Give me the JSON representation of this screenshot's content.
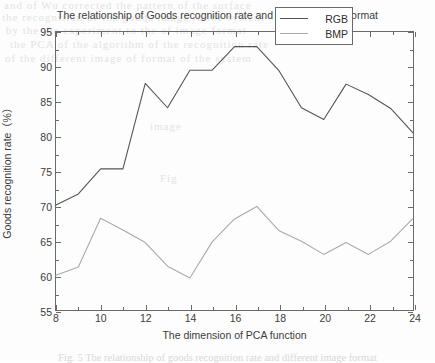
{
  "chart_data": {
    "type": "line",
    "title": "The relationship of Goods recognition rate and different image format",
    "xlabel": "The dimension of PCA function",
    "ylabel": "Goods recognition rate（%）",
    "xlim": [
      8,
      24
    ],
    "ylim": [
      55,
      95
    ],
    "xticks": [
      8,
      10,
      12,
      14,
      16,
      18,
      20,
      22,
      24
    ],
    "yticks": [
      55,
      60,
      65,
      70,
      75,
      80,
      85,
      90,
      95
    ],
    "xticklabels": [
      "8",
      "10",
      "12",
      "14",
      "16",
      "18",
      "20",
      "22",
      "24"
    ],
    "yticklabels": [
      "55",
      "60",
      "65",
      "70",
      "75",
      "80",
      "85",
      "90",
      "95"
    ],
    "x": [
      8,
      9,
      10,
      11,
      12,
      13,
      14,
      15,
      16,
      17,
      18,
      19,
      20,
      21,
      22,
      23,
      24
    ],
    "grid": false,
    "legend_position": "upper right",
    "series": [
      {
        "name": "RGB",
        "color": "#555555",
        "values": [
          70.1,
          71.7,
          75.3,
          75.3,
          87.6,
          84.1,
          89.5,
          89.5,
          92.9,
          92.9,
          89.4,
          84.1,
          82.4,
          87.5,
          86.0,
          84.0,
          80.5
        ]
      },
      {
        "name": "BMP",
        "color": "#aaaaaa",
        "values": [
          60.0,
          61.2,
          68.2,
          66.5,
          64.7,
          61.3,
          59.6,
          64.8,
          68.1,
          69.9,
          66.4,
          64.9,
          63.0,
          64.7,
          63.0,
          64.9,
          68.2
        ]
      }
    ]
  },
  "legend": {
    "items": [
      {
        "label": "RGB",
        "color": "#555555"
      },
      {
        "label": "BMP",
        "color": "#aaaaaa"
      }
    ]
  },
  "caption": {
    "text": "Fig. 5  The relationship of goods recognition rate and different image format"
  },
  "artifacts": {
    "bleed_lines": [
      "and of Wu corrected the pattern of the surface",
      "the recognition of the goods image in the system",
      "by the the experiment to the of image format",
      "the PCA of the algorithm of the recognition rate",
      "of the different image of format of the system"
    ],
    "bleed_marks": [
      "image",
      "Fig"
    ]
  }
}
